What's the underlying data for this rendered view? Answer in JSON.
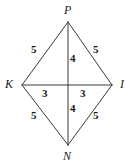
{
  "figure": {
    "stroke_color": "#3a3a3a",
    "label_color": "#1a1a1a",
    "background_color": "#ffffff",
    "vertices": [
      {
        "name": "P",
        "label": "P",
        "x": 68,
        "y": 22,
        "label_x": 64,
        "label_y": 4
      },
      {
        "name": "K",
        "label": "K",
        "x": 22,
        "y": 85,
        "label_x": 5,
        "label_y": 78
      },
      {
        "name": "I",
        "label": "I",
        "x": 112,
        "y": 85,
        "label_x": 120,
        "label_y": 78
      },
      {
        "name": "N",
        "label": "N",
        "x": 68,
        "y": 145,
        "label_x": 63,
        "label_y": 150
      }
    ],
    "center": {
      "x": 68,
      "y": 85
    },
    "sides": [
      {
        "name": "side-PK",
        "from": "P",
        "to": "K",
        "length": "5",
        "label_x": 31,
        "label_y": 44
      },
      {
        "name": "side-PI",
        "from": "P",
        "to": "I",
        "length": "5",
        "label_x": 93,
        "label_y": 44
      },
      {
        "name": "side-KN",
        "from": "K",
        "to": "N",
        "length": "5",
        "label_x": 31,
        "label_y": 110
      },
      {
        "name": "side-NI",
        "from": "N",
        "to": "I",
        "length": "5",
        "label_x": 93,
        "label_y": 110
      }
    ],
    "diagonals": [
      {
        "name": "diagonal-PN",
        "from": "P",
        "to": "N"
      },
      {
        "name": "diagonal-KI",
        "from": "K",
        "to": "I"
      }
    ],
    "segments": [
      {
        "name": "segment-P-center",
        "length": "4",
        "label_x": 70,
        "label_y": 53
      },
      {
        "name": "segment-center-N",
        "length": "4",
        "label_x": 70,
        "label_y": 103
      },
      {
        "name": "segment-K-center",
        "length": "3",
        "label_x": 42,
        "label_y": 88
      },
      {
        "name": "segment-center-I",
        "length": "3",
        "label_x": 80,
        "label_y": 88
      }
    ]
  }
}
